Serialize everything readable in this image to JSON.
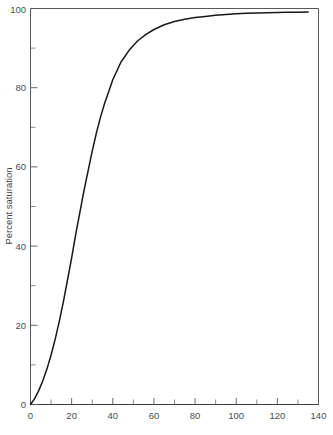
{
  "figure": {
    "background_color": "#ffffff",
    "curve_color": "#17181a",
    "axis_color": "#55585b",
    "caption_partial": "curve"
  },
  "axes": {
    "y": {
      "title": "Percent saturation",
      "min": 0,
      "max": 100,
      "major_ticks": [
        0,
        20,
        40,
        60,
        80,
        100
      ],
      "minor_ticks": [
        10,
        30,
        50,
        70,
        90
      ],
      "tick_labels": [
        "0",
        "20",
        "40",
        "60",
        "80",
        "100"
      ]
    },
    "x": {
      "title": "",
      "min": 0,
      "max": 140,
      "major_ticks": [
        0,
        20,
        40,
        60,
        80,
        100,
        120,
        140
      ],
      "minor_ticks": [
        10,
        30,
        50,
        70,
        90,
        110,
        130
      ],
      "tick_labels": [
        "0",
        "20",
        "40",
        "60",
        "80",
        "100",
        "120",
        "140"
      ]
    }
  },
  "chart_data": {
    "type": "line",
    "title": "",
    "subtitle": "",
    "xlabel": "",
    "ylabel": "Percent saturation",
    "xlim": [
      0,
      140
    ],
    "ylim": [
      0,
      100
    ],
    "grid": false,
    "legend": null,
    "legend_position": "none",
    "annotations": [],
    "series": [
      {
        "name": "Percent saturation",
        "x": [
          0,
          2,
          4,
          6,
          8,
          10,
          12,
          14,
          16,
          18,
          20,
          22,
          24,
          26,
          28,
          30,
          32,
          34,
          36,
          38,
          40,
          44,
          48,
          52,
          56,
          60,
          65,
          70,
          75,
          80,
          85,
          90,
          95,
          100,
          105,
          110,
          115,
          120,
          125,
          130,
          135
        ],
        "y": [
          0,
          1.5,
          3.5,
          6.0,
          9.0,
          12.5,
          16.5,
          21.0,
          26.0,
          31.5,
          37.0,
          43.0,
          48.5,
          54.0,
          59.0,
          64.0,
          68.5,
          72.5,
          76.0,
          79.0,
          82.0,
          86.5,
          89.5,
          91.8,
          93.4,
          94.7,
          95.9,
          96.7,
          97.3,
          97.7,
          98.0,
          98.3,
          98.5,
          98.65,
          98.78,
          98.88,
          98.95,
          99.0,
          99.05,
          99.08,
          99.1
        ]
      }
    ]
  }
}
